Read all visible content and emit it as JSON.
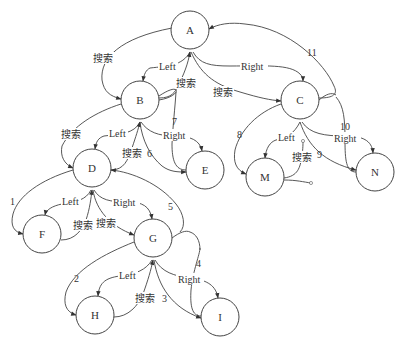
{
  "diagram": {
    "type": "binary-tree-threaded-search",
    "nodes": [
      {
        "id": "A",
        "label": "A",
        "x": 190,
        "y": 30
      },
      {
        "id": "B",
        "label": "B",
        "x": 140,
        "y": 100
      },
      {
        "id": "C",
        "label": "C",
        "x": 300,
        "y": 100
      },
      {
        "id": "D",
        "label": "D",
        "x": 92,
        "y": 168
      },
      {
        "id": "E",
        "label": "E",
        "x": 205,
        "y": 170
      },
      {
        "id": "M",
        "label": "M",
        "x": 265,
        "y": 177
      },
      {
        "id": "N",
        "label": "N",
        "x": 375,
        "y": 172
      },
      {
        "id": "F",
        "label": "F",
        "x": 42,
        "y": 234
      },
      {
        "id": "G",
        "label": "G",
        "x": 153,
        "y": 238
      },
      {
        "id": "H",
        "label": "H",
        "x": 95,
        "y": 315
      },
      {
        "id": "I",
        "label": "I",
        "x": 220,
        "y": 317
      }
    ],
    "labels": {
      "left": "Left",
      "right": "Right",
      "search": "搜索"
    },
    "edges": [
      {
        "from": "A",
        "to": "B",
        "label": "Left",
        "kind": "child"
      },
      {
        "from": "A",
        "to": "C",
        "label": "Right",
        "kind": "child"
      },
      {
        "from": "A",
        "to": "B",
        "label": "搜索",
        "kind": "search"
      },
      {
        "from": "B",
        "to": "A",
        "label": "搜索",
        "kind": "return"
      },
      {
        "from": "A",
        "to": "C",
        "label": "搜索",
        "kind": "search"
      },
      {
        "from": "B",
        "to": "D",
        "label": "Left",
        "kind": "child"
      },
      {
        "from": "B",
        "to": "E",
        "label": "Right",
        "kind": "child"
      },
      {
        "from": "B",
        "to": "D",
        "label": "搜索",
        "kind": "search"
      },
      {
        "from": "D",
        "to": "B",
        "label": "搜索",
        "kind": "return"
      },
      {
        "from": "D",
        "to": "F",
        "label": "Left",
        "kind": "child"
      },
      {
        "from": "D",
        "to": "G",
        "label": "Right",
        "kind": "child"
      },
      {
        "from": "F",
        "to": "D",
        "label": "搜索",
        "kind": "return"
      },
      {
        "from": "D",
        "to": "G",
        "label": "搜索",
        "kind": "search"
      },
      {
        "from": "G",
        "to": "H",
        "label": "Left",
        "kind": "child"
      },
      {
        "from": "G",
        "to": "I",
        "label": "Right",
        "kind": "child"
      },
      {
        "from": "H",
        "to": "G",
        "label": "搜索",
        "kind": "return"
      },
      {
        "from": "C",
        "to": "M",
        "label": "Left",
        "kind": "child"
      },
      {
        "from": "C",
        "to": "N",
        "label": "Right",
        "kind": "child"
      },
      {
        "from": "M",
        "to": "C",
        "label": "搜索",
        "kind": "return-null"
      },
      {
        "from": "D",
        "to": "F",
        "label": "1",
        "kind": "step"
      },
      {
        "from": "G",
        "to": "H",
        "label": "2",
        "kind": "step"
      },
      {
        "from": "G",
        "to": "I",
        "label": "3",
        "kind": "step"
      },
      {
        "from": "I",
        "to": "G",
        "label": "4",
        "kind": "step"
      },
      {
        "from": "G",
        "to": "D",
        "label": "5",
        "kind": "step"
      },
      {
        "from": "B",
        "to": "E",
        "label": "6",
        "kind": "step"
      },
      {
        "from": "E",
        "to": "B",
        "label": "7",
        "kind": "step"
      },
      {
        "from": "C",
        "to": "M",
        "label": "8",
        "kind": "step"
      },
      {
        "from": "C",
        "to": "N",
        "label": "9",
        "kind": "step"
      },
      {
        "from": "N",
        "to": "C",
        "label": "10",
        "kind": "step"
      },
      {
        "from": "C",
        "to": "A",
        "label": "11",
        "kind": "step"
      }
    ]
  }
}
